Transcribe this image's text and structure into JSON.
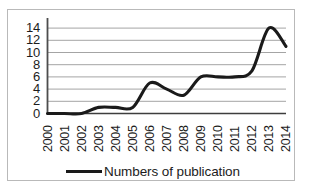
{
  "chart_data": {
    "type": "line",
    "title": "",
    "xlabel": "",
    "ylabel": "",
    "grid": true,
    "legend_position": "bottom",
    "xlim": [
      2000,
      2014
    ],
    "ylim": [
      0,
      15
    ],
    "y_ticks": [
      0,
      2,
      4,
      6,
      8,
      10,
      12,
      14
    ],
    "x_ticks": [
      "2000",
      "2001",
      "2002",
      "2003",
      "2004",
      "2005",
      "2006",
      "2007",
      "2008",
      "2009",
      "2010",
      "2011",
      "2012",
      "2013",
      "2014"
    ],
    "series": [
      {
        "name": "Numbers of publication",
        "color": "#1a1a1a",
        "smooth": true,
        "x": [
          2000,
          2001,
          2002,
          2003,
          2004,
          2005,
          2006,
          2007,
          2008,
          2009,
          2010,
          2011,
          2012,
          2013,
          2014
        ],
        "values": [
          0,
          0,
          0,
          1,
          1,
          1,
          5,
          4,
          3,
          6,
          6,
          6,
          7,
          14,
          11
        ]
      }
    ]
  },
  "legend": {
    "entries": [
      {
        "label": "Numbers of publication",
        "color": "#1a1a1a"
      }
    ]
  },
  "axes": {
    "y_tick_labels": [
      "14",
      "12",
      "10",
      "8",
      "6",
      "4",
      "2",
      "0"
    ],
    "x_tick_labels": [
      "2000",
      "2001",
      "2002",
      "2003",
      "2004",
      "2005",
      "2006",
      "2007",
      "2008",
      "2009",
      "2010",
      "2011",
      "2012",
      "2013",
      "2014"
    ]
  },
  "style": {
    "grid_color": "#9a9a9a",
    "axis_color": "#4d4d4d",
    "line_color": "#1a1a1a",
    "frame_color": "#b9b9b9",
    "background": "#ffffff",
    "text_color": "#1c1c1c"
  }
}
